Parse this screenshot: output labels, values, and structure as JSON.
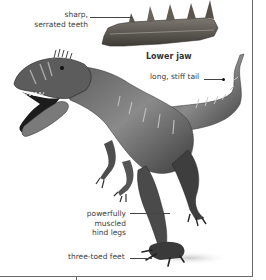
{
  "figure": {
    "inset_caption": "Lower jaw",
    "annotations": [
      {
        "id": "teeth",
        "lines": [
          "sharp,",
          "serrated teeth"
        ]
      },
      {
        "id": "tail",
        "lines": [
          "long, stiff tail"
        ]
      },
      {
        "id": "legs",
        "lines": [
          "powerfully",
          "muscled",
          "hind legs"
        ]
      },
      {
        "id": "feet",
        "lines": [
          "three-toed feet"
        ]
      }
    ],
    "colors": {
      "frame": "#6a6a6a",
      "text": "#3c3c3c",
      "leader": "#444444",
      "skin_dark": "#3b3b3b",
      "skin_mid": "#7a7a7a",
      "skin_light": "#b5b5b5",
      "bone": "#6e6a64"
    }
  }
}
